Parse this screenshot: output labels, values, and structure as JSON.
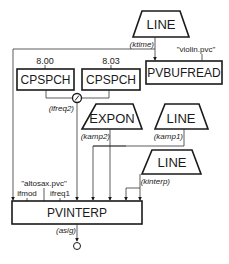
{
  "diagram": {
    "nodes": {
      "line_ktime": {
        "label": "LINE",
        "output": "(ktime)"
      },
      "pvbufread": {
        "label": "PVBUFREAD",
        "param": "\"violin.pvc\""
      },
      "cpspch1": {
        "label": "CPSPCH",
        "input": "8.00"
      },
      "cpspch2": {
        "label": "CPSPCH",
        "input": "8.03"
      },
      "divide": {
        "symbol": "/",
        "output": "(ifreq2)"
      },
      "expon": {
        "label": "EXPON",
        "output": "(kamp2)"
      },
      "line_kamp1": {
        "label": "LINE",
        "output": "(kamp1)"
      },
      "line_kinterp": {
        "label": "LINE",
        "output": "(kinterp)"
      },
      "pvinterp": {
        "label": "PVINTERP",
        "param": "\"altosax.pvc\"",
        "inputs": [
          "ifmod",
          "ifreq1"
        ],
        "output": "(asig)"
      }
    }
  }
}
